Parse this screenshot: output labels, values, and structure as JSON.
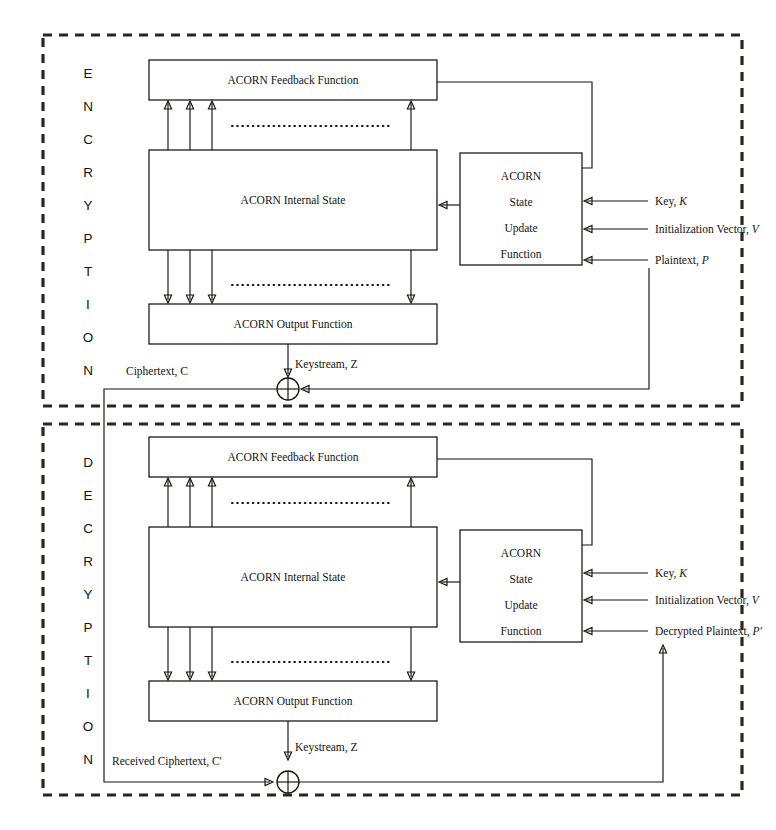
{
  "figure": {
    "type": "block-diagram"
  },
  "sections": [
    {
      "id": "encryption",
      "vertical_title": "ENCRYPTION",
      "letters": [
        "E",
        "N",
        "C",
        "R",
        "Y",
        "P",
        "T",
        "I",
        "O",
        "N"
      ],
      "blocks": {
        "feedback": "ACORN Feedback Function",
        "internal_state": "ACORN Internal State",
        "output": "ACORN Output Function",
        "state_update_lines": [
          "ACORN",
          "State",
          "Update",
          "Function"
        ]
      },
      "inputs": [
        {
          "text": "Key, ",
          "symbol": "K"
        },
        {
          "text": "Initialization Vector, ",
          "symbol": "V"
        },
        {
          "text": "Plaintext, ",
          "symbol": "P"
        }
      ],
      "flows": [
        {
          "name": "keystream",
          "text": "Keystream, ",
          "symbol": "Z"
        },
        {
          "name": "ciphertext",
          "text": "Ciphertext, ",
          "symbol": "C"
        }
      ],
      "operator": "xor"
    },
    {
      "id": "decryption",
      "vertical_title": "DECRYPTION",
      "letters": [
        "D",
        "E",
        "C",
        "R",
        "Y",
        "P",
        "T",
        "I",
        "O",
        "N"
      ],
      "blocks": {
        "feedback": "ACORN Feedback Function",
        "internal_state": "ACORN Internal State",
        "output": "ACORN Output Function",
        "state_update_lines": [
          "ACORN",
          "State",
          "Update",
          "Function"
        ]
      },
      "inputs": [
        {
          "text": "Key, ",
          "symbol": "K"
        },
        {
          "text": "Initialization Vector, ",
          "symbol": "V"
        },
        {
          "text": "Decrypted Plaintext, ",
          "symbol": "P'"
        }
      ],
      "flows": [
        {
          "name": "keystream",
          "text": "Keystream, ",
          "symbol": "Z"
        },
        {
          "name": "received-ciphertext",
          "text": "Received Ciphertext, ",
          "symbol": "C'"
        }
      ],
      "operator": "xor"
    }
  ],
  "colors": {
    "ink": "#16130f",
    "frame": "#2a2622",
    "paper": "#ffffff"
  }
}
